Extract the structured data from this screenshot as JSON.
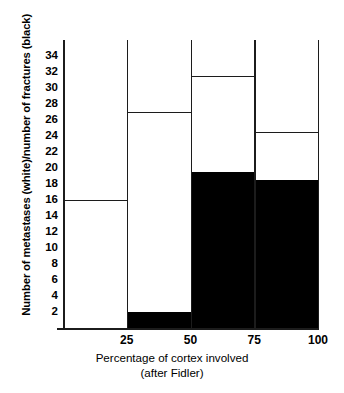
{
  "chart_data": {
    "type": "bar",
    "title": "",
    "xlabel": "Percentage of cortex involved",
    "xlabel_sub": "(after Fidler)",
    "ylabel": "Number of metastases (white)/number of fractures (black)",
    "categories": [
      "0-25",
      "25-50",
      "50-75",
      "75-100"
    ],
    "xtick_labels": [
      "25",
      "50",
      "75",
      "100"
    ],
    "xtick_values": [
      25,
      50,
      75,
      100
    ],
    "ytick_labels": [
      "2",
      "4",
      "6",
      "8",
      "10",
      "12",
      "14",
      "16",
      "18",
      "20",
      "22",
      "24",
      "26",
      "28",
      "30",
      "32",
      "34"
    ],
    "ytick_values": [
      2,
      4,
      6,
      8,
      10,
      12,
      14,
      16,
      18,
      20,
      22,
      24,
      26,
      28,
      30,
      32,
      34
    ],
    "ylim": [
      0,
      36
    ],
    "xlim": [
      0,
      100
    ],
    "grid": false,
    "legend": "encoded in y-axis label: white = metastases, black = fractures",
    "series": [
      {
        "name": "Number of metastases (white)",
        "color": "#ffffff",
        "values": [
          16,
          27,
          31.5,
          24.5
        ]
      },
      {
        "name": "Number of fractures (black)",
        "color": "#000000",
        "values": [
          0,
          2,
          19.5,
          18.5
        ]
      }
    ]
  },
  "figure": {
    "plot_left_px": 63,
    "plot_top_px": 40,
    "plot_width_px": 255,
    "plot_height_px": 288
  }
}
